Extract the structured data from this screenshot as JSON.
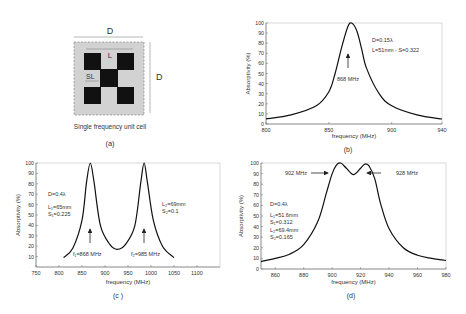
{
  "panel_a": {
    "label": "(a)",
    "caption": "Single frequency unit cell",
    "dim_outer": "D",
    "dim_side": "D",
    "dim_L": "L",
    "dim_SL": "SL"
  },
  "panel_b": {
    "label": "(b)",
    "annot1": "D=0.15λ",
    "annot2": "L=51mm - S=0.322",
    "peak_label": "868 MHz"
  },
  "panel_c": {
    "label": "(c )",
    "annot1": "D=0.4λ",
    "annot2": "L₁=65mm",
    "annot3": "S₁=0.225",
    "annot4": "L₂=69mm",
    "annot5": "S₂=0.1",
    "peak1_label": "f₁=868 MHz",
    "peak2_label": "f₂=985 MHz"
  },
  "panel_d": {
    "label": "(d)",
    "annot1": "D=0.4λ",
    "annot2": "L₁=51.6mm",
    "annot3": "S₁=0.312",
    "annot4": "L₂=69.4mm",
    "annot5": "S₂=0.165",
    "peak1_label": "902 MHz",
    "peak2_label": "928 MHz"
  },
  "chart_data": [
    {
      "type": "line",
      "panel": "b",
      "xlabel": "frequency (MHz)",
      "ylabel": "Absorptivity (%)",
      "xlim": [
        800,
        940
      ],
      "ylim": [
        0,
        100
      ],
      "xticks": [
        800,
        850,
        900,
        940
      ],
      "yticks": [
        0,
        10,
        20,
        30,
        40,
        50,
        60,
        70,
        80,
        90,
        100
      ],
      "series": [
        {
          "name": "absorptivity",
          "x": [
            800,
            820,
            840,
            850,
            855,
            860,
            865,
            868,
            872,
            876,
            880,
            890,
            900,
            920,
            940
          ],
          "y": [
            5,
            9,
            18,
            32,
            50,
            75,
            96,
            100,
            93,
            75,
            55,
            30,
            18,
            9,
            5
          ]
        }
      ],
      "annotations": [
        "D=0.15λ",
        "L=51mm - S=0.322",
        "868 MHz"
      ]
    },
    {
      "type": "line",
      "panel": "c",
      "xlabel": "frequency (MHz)",
      "ylabel": "Absorptivity (%)",
      "xlim": [
        750,
        1150
      ],
      "ylim": [
        0,
        100
      ],
      "xticks": [
        750,
        800,
        850,
        900,
        950,
        1000,
        1050,
        1100
      ],
      "yticks": [
        10,
        20,
        30,
        40,
        50,
        60,
        70,
        80,
        90,
        100
      ],
      "series": [
        {
          "name": "absorptivity",
          "x": [
            810,
            830,
            850,
            860,
            868,
            876,
            890,
            910,
            927,
            945,
            965,
            978,
            985,
            992,
            1005,
            1025,
            1050
          ],
          "y": [
            9,
            18,
            45,
            82,
            100,
            82,
            40,
            22,
            17,
            22,
            40,
            82,
            100,
            82,
            45,
            20,
            9
          ]
        }
      ],
      "annotations": [
        "D=0.4λ",
        "L₁=65mm",
        "S₁=0.225",
        "L₂=69mm",
        "S₂=0.1",
        "f₁=868 MHz",
        "f₂=985 MHz"
      ]
    },
    {
      "type": "line",
      "panel": "d",
      "xlabel": "frequency (MHz)",
      "ylabel": "Absorptivity (%)",
      "xlim": [
        850,
        980
      ],
      "ylim": [
        0,
        100
      ],
      "xticks": [
        860,
        880,
        900,
        920,
        940,
        960,
        980
      ],
      "yticks": [
        0,
        10,
        20,
        30,
        40,
        50,
        60,
        70,
        80,
        90,
        100
      ],
      "series": [
        {
          "name": "absorptivity",
          "x": [
            850,
            860,
            870,
            880,
            890,
            896,
            900,
            903,
            906,
            910,
            915,
            920,
            923,
            926,
            930,
            934,
            940,
            950,
            960,
            970,
            980
          ],
          "y": [
            7,
            10,
            14,
            23,
            45,
            72,
            90,
            98,
            100,
            95,
            89,
            95,
            99,
            97,
            85,
            62,
            38,
            20,
            13,
            10,
            8
          ]
        }
      ],
      "annotations": [
        "D=0.4λ",
        "L₁=51.6mm",
        "S₁=0.312",
        "L₂=69.4mm",
        "S₂=0.165",
        "902 MHz",
        "928 MHz"
      ]
    }
  ]
}
